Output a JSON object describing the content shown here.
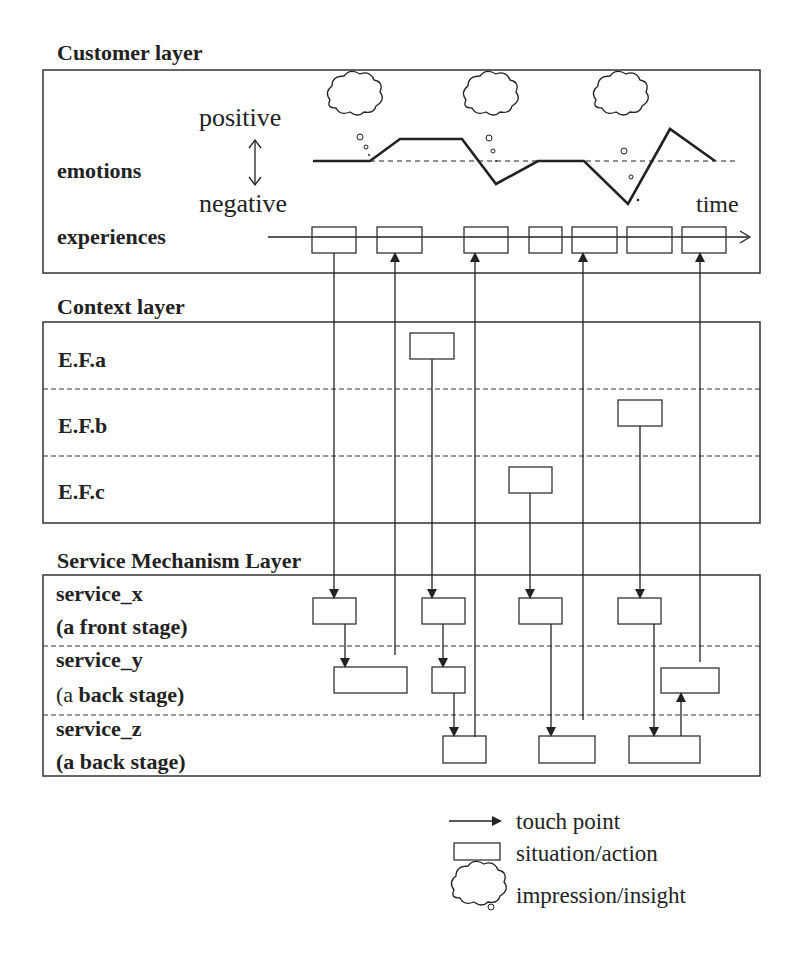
{
  "layers": {
    "customer": {
      "title": "Customer layer",
      "emotions": "emotions",
      "experiences": "experiences",
      "positive": "positive",
      "negative": "negative",
      "time": "time"
    },
    "context": {
      "title": "Context layer",
      "rows": [
        "E.F.a",
        "E.F.b",
        "E.F.c"
      ]
    },
    "service": {
      "title": "Service Mechanism Layer",
      "rows": [
        {
          "name": "service_x",
          "stage": "(a front stage)"
        },
        {
          "name": "service_y",
          "stage_prefix": "(a ",
          "stage": "back stage)"
        },
        {
          "name": "service_z",
          "stage": "(a back stage)"
        }
      ]
    }
  },
  "legend": {
    "touch_point": "touch point",
    "situation": "situation/action",
    "impression": "impression/insight"
  }
}
